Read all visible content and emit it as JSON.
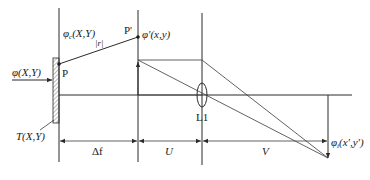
{
  "diagram": {
    "colors": {
      "line": "#2a2a2a",
      "background": "#ffffff",
      "hatch": "#555555"
    },
    "labels": {
      "incident_wave": "φ(X,Y)",
      "transmittance": "T(X,Y)",
      "object_wave": "φc(X,Y)",
      "point_p": "P",
      "point_p_prime": "P'",
      "distance_r": "|r|",
      "propagated_wave": "φ'(x,y)",
      "lens": "L1",
      "image_wave": "φi(x',y')",
      "dim_delta_f": "Δf",
      "dim_u": "U",
      "dim_v": "V"
    },
    "planes": [
      {
        "name": "hologram-plane",
        "x": 59
      },
      {
        "name": "intermediate-plane",
        "x": 138
      },
      {
        "name": "lens-plane",
        "x": 202
      },
      {
        "name": "image-plane",
        "x": 328
      }
    ],
    "optical_axis_y": 95,
    "dimension_line_y": 141
  }
}
